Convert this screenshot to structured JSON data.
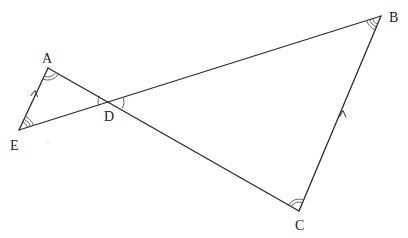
{
  "diagram": {
    "type": "geometry",
    "points": {
      "A": {
        "label": "A",
        "x": 48,
        "y": 68
      },
      "B": {
        "label": "B",
        "x": 381,
        "y": 16
      },
      "C": {
        "label": "C",
        "x": 299,
        "y": 211
      },
      "D": {
        "label": "D",
        "x": 111,
        "y": 102
      },
      "E": {
        "label": "E",
        "x": 19,
        "y": 130
      }
    },
    "segments": [
      "AE",
      "AC",
      "EB",
      "BC"
    ],
    "parallel_marks": [
      "AE",
      "BC"
    ],
    "angle_marks": {
      "A": "double",
      "E": "triple",
      "B": "triple",
      "C": "double",
      "D": "single-both-sides"
    }
  }
}
